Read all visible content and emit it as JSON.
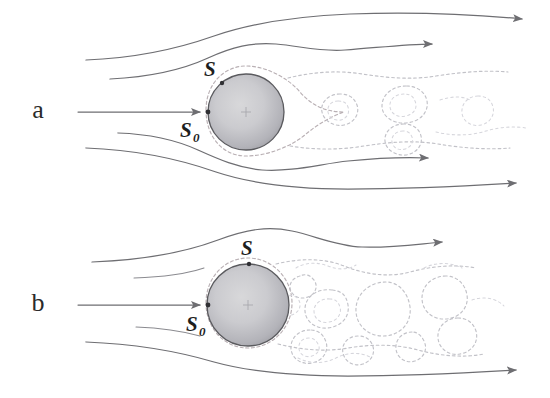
{
  "figure": {
    "title": "",
    "background_color": "#ffffff",
    "width": 550,
    "height": 398,
    "stroke_color": "#6e6e72",
    "dash_color": "#c2c2c8",
    "sphere_edge_color": "#5a5a5e",
    "sphere_fill_center": "#d2d2d4",
    "sphere_fill_edge": "#9d9da2"
  },
  "panels": [
    {
      "id": "a",
      "label": "a",
      "label_x": 38,
      "label_y": 118,
      "sphere": {
        "cx": 246,
        "cy": 112,
        "r": 38
      },
      "separation_label": "S",
      "separation_label_x": 204,
      "separation_label_y": 76,
      "separation_sub_label": "S",
      "separation_sub_sub": "0",
      "separation_sub_x": 180,
      "separation_sub_y": 137,
      "separation_point_top": {
        "x": 222,
        "y": 82
      },
      "stagnation_point": {
        "x": 208,
        "y": 112
      },
      "regime_note": "organized separated wake with discrete vortex loops"
    },
    {
      "id": "b",
      "label": "b",
      "label_x": 38,
      "label_y": 311,
      "sphere": {
        "cx": 248,
        "cy": 305,
        "r": 41
      },
      "separation_label": "S",
      "separation_label_x": 241,
      "separation_label_y": 255,
      "separation_sub_label": "S",
      "separation_sub_sub": "0",
      "separation_sub_x": 186,
      "separation_sub_y": 331,
      "separation_point_top": {
        "x": 249,
        "y": 264
      },
      "stagnation_point": {
        "x": 208,
        "y": 305
      },
      "regime_note": "turbulent wake with many chaotic vortex loops"
    }
  ],
  "annotations": {
    "inflow_arrow_label": "",
    "outflow_arrow_label": ""
  }
}
